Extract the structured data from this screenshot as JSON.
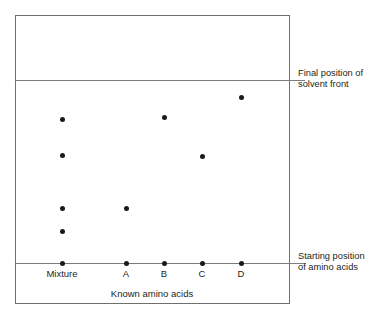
{
  "diagram": {
    "type": "paper-chromatography",
    "plate": {
      "solvent_front_label": "Final position of\nsolvent front",
      "solvent_front_line1": "Final position of",
      "solvent_front_line2": "solvent front",
      "start_position_line1": "Starting position",
      "start_position_line2": "of amino acids"
    },
    "x_axis_title": "Known amino acids",
    "columns": [
      {
        "id": "mixture",
        "label": "Mixture",
        "x": 62
      },
      {
        "id": "a",
        "label": "A",
        "x": 126
      },
      {
        "id": "b",
        "label": "B",
        "x": 164
      },
      {
        "id": "c",
        "label": "C",
        "x": 202
      },
      {
        "id": "d",
        "label": "D",
        "x": 241
      }
    ]
  },
  "chart_data": {
    "type": "scatter",
    "title": "",
    "xlabel": "Known amino acids",
    "ylabel": "",
    "grid": false,
    "legend": null,
    "axis_lines": {
      "solvent_front_y": 80,
      "baseline_y": 263
    },
    "categories": [
      "Mixture",
      "A",
      "B",
      "C",
      "D"
    ],
    "series": [
      {
        "name": "Mixture",
        "x": 62,
        "spots_y": [
          119,
          155,
          208,
          231,
          263
        ],
        "spot_count": 5
      },
      {
        "name": "A",
        "x": 126,
        "spots_y": [
          208,
          263
        ],
        "spot_count": 2
      },
      {
        "name": "B",
        "x": 164,
        "spots_y": [
          117,
          263
        ],
        "spot_count": 2
      },
      {
        "name": "C",
        "x": 202,
        "spots_y": [
          156,
          263
        ],
        "spot_count": 2
      },
      {
        "name": "D",
        "x": 241,
        "spots_y": [
          97,
          263
        ],
        "spot_count": 2
      }
    ],
    "annotations": [
      {
        "text": "Final position of solvent front",
        "at_y": 80,
        "side": "right"
      },
      {
        "text": "Starting position of amino acids",
        "at_y": 263,
        "side": "right"
      }
    ]
  },
  "colors": {
    "spot": "#1a1a1a",
    "line": "#7d7d7d",
    "border": "#6f6f6f",
    "text": "#231f20",
    "background": "#ffffff"
  }
}
